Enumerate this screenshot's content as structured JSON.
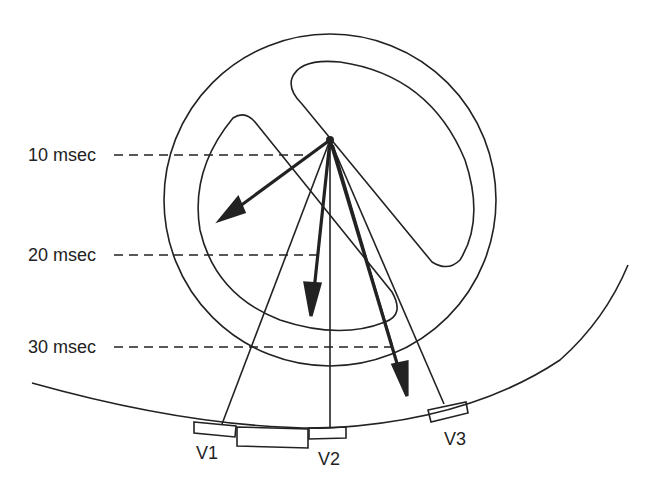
{
  "diagram": {
    "type": "ecg-vector-diagram",
    "time_labels": [
      {
        "label": "10 msec"
      },
      {
        "label": "20 msec"
      },
      {
        "label": "30 msec"
      }
    ],
    "leads": [
      {
        "label": "V1"
      },
      {
        "label": "V2"
      },
      {
        "label": "V3"
      }
    ],
    "colors": {
      "stroke": "#222222",
      "background": "#ffffff"
    }
  }
}
